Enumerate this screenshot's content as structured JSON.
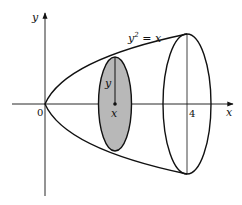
{
  "diagram": {
    "axes": {
      "x_label": "x",
      "y_label": "y",
      "origin_label": "0"
    },
    "curve": {
      "equation_lhs": "y",
      "equation_exp": "2",
      "equation_rhs": " = x"
    },
    "cross_section": {
      "radius_label": "y",
      "position_label": "x",
      "fill_color": "#b8b8b8"
    },
    "end": {
      "x_value_label": "4"
    },
    "colors": {
      "stroke": "#111111",
      "background": "#ffffff"
    }
  }
}
